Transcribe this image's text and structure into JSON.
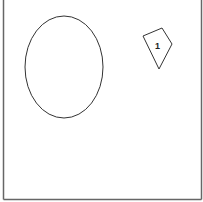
{
  "diagram": {
    "frame": {
      "stroke": "#666666"
    },
    "ellipse": {
      "cx": 64,
      "cy": 67,
      "rx": 39,
      "ry": 51,
      "stroke": "#333333"
    },
    "kite": {
      "points": "143,36 162,28 172,44 159,69",
      "stroke": "#333333",
      "label": "1",
      "label_x": 157,
      "label_y": 48
    }
  }
}
